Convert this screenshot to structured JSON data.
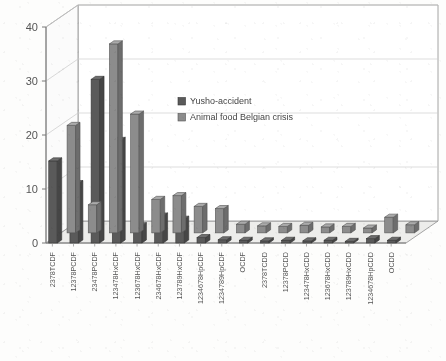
{
  "chart_data": {
    "type": "bar",
    "title": "",
    "subtitle": "",
    "xlabel": "",
    "ylabel": "",
    "ylim": [
      0,
      40
    ],
    "yticks": [
      0,
      10,
      20,
      30,
      40
    ],
    "grid": true,
    "three_d": true,
    "legend_position": "inside-upper-center",
    "categories": [
      "2378TCDF",
      "12378PCDF",
      "23478PCDF",
      "123478HxCDF",
      "123678HxCDF",
      "234678HxCDF",
      "123789HxCDF",
      "1234678HpCDF",
      "1234789HpCDF",
      "OCDF",
      "2378TCDD",
      "12378PCDD",
      "123478HxCDD",
      "123678HxCDD",
      "123789HxCDD",
      "1234678HpCDD",
      "OCDD"
    ],
    "series": [
      {
        "name": "Yusho-accident",
        "color": "#5a5a5a",
        "values": [
          15.2,
          11.0,
          30.3,
          19.0,
          3.2,
          5.0,
          4.4,
          1.0,
          0.6,
          0.5,
          0.4,
          0.5,
          0.4,
          0.5,
          0.3,
          0.8,
          0.5
        ]
      },
      {
        "name": "Animal food Belgian crisis",
        "color": "#8c8c8c",
        "values": [
          19.9,
          5.2,
          35.0,
          22.0,
          6.2,
          6.9,
          4.9,
          4.5,
          1.6,
          1.3,
          1.2,
          1.4,
          1.1,
          1.2,
          0.9,
          2.9,
          1.5
        ]
      }
    ]
  },
  "legend": {
    "items": [
      {
        "label": "Yusho-accident",
        "color": "#5a5a5a"
      },
      {
        "label": "Animal food Belgian crisis",
        "color": "#8c8c8c"
      }
    ]
  },
  "axes": {
    "y": {
      "labels": [
        "40",
        "30",
        "20",
        "10",
        "0"
      ]
    }
  }
}
